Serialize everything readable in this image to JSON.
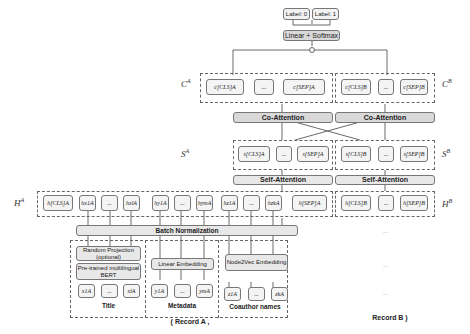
{
  "output": {
    "label0": "Label: 0",
    "label1": "Label: 1",
    "classifier": "Linear + Softmax",
    "concat": "○"
  },
  "c_layer": {
    "label_a": "C^A",
    "label_b": "C^B",
    "a_tokens": [
      "c[CLS]A",
      "...",
      "c[SEP]A"
    ],
    "b_tokens": [
      "c[CLS]B",
      "...",
      "c[SEP]B"
    ]
  },
  "co_attention": {
    "a": "Co-Attention",
    "b": "Co-Attention"
  },
  "s_layer": {
    "label_a": "S^A",
    "label_b": "S^B",
    "a_tokens": [
      "s[CLS]A",
      "...",
      "s[SEP]A"
    ],
    "b_tokens": [
      "s[CLS]B",
      "...",
      "s[SEP]B"
    ]
  },
  "self_attention": {
    "a": "Self-Attention",
    "b": "Self-Attention"
  },
  "h_layer": {
    "label_a": "H^A",
    "label_b": "H^B",
    "a_tokens": [
      "h[CLS]A",
      "hx1A",
      "...",
      "hxlA",
      "hy1A",
      "...",
      "hymA",
      "hz1A",
      "...",
      "hzkA",
      "h[SEP]A"
    ],
    "b_tokens": [
      "h[CLS]B",
      "...",
      "h[SEP]B"
    ]
  },
  "batch_norm": "Batch Normalization",
  "title_branch": {
    "random_projection": "Random Projection (optional)",
    "bert": "Pre-trained multilingual BERT",
    "tokens": [
      "x1A",
      "...",
      "xlA"
    ],
    "caption": "Title"
  },
  "metadata_branch": {
    "embedding": "Linear Embedding",
    "tokens": [
      "y1A",
      "...",
      "ymA"
    ],
    "caption": "Metadata"
  },
  "coauthor_branch": {
    "embedding": "Node2Vec Embedding",
    "tokens": [
      "z1A",
      "...",
      "zkA"
    ],
    "caption": "Coauthor names"
  },
  "record_a": "( Record A ,",
  "record_b": "Record B )",
  "ellipsis": "..."
}
